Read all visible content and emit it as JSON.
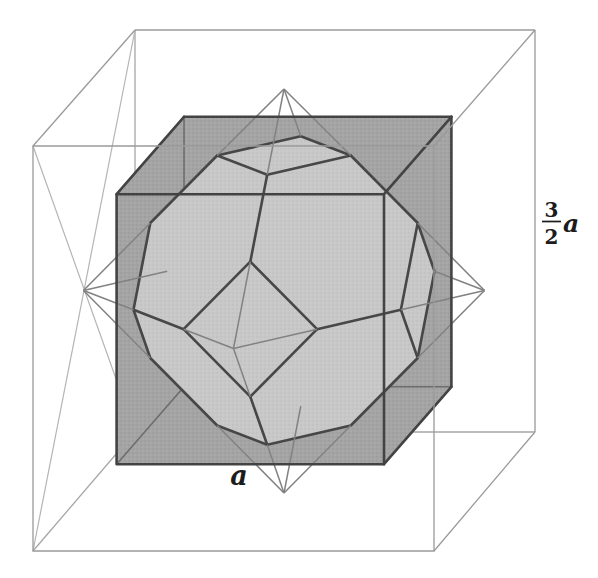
{
  "diagram": {
    "shapes": [
      "outer-cube",
      "inscribed-octahedron",
      "inner-cube",
      "truncated-octahedron"
    ],
    "labels": {
      "outer_edge_length": {
        "numerator": "3",
        "denominator": "2",
        "variable": "a"
      },
      "inner_edge_length": {
        "variable": "a"
      }
    },
    "colors": {
      "background": "#ffffff",
      "outer_cube_line": "#9a9a9a",
      "face_diagonal_line": "#b5b5b5",
      "octahedron_line": "#828282",
      "inner_cube_fill": "#a4a4a4",
      "truncated_octahedron_fill": "#c8c8c8",
      "bold_edge": "#474747",
      "hidden_edge": "#6d6d6d",
      "label_text": "#1c1c1c"
    }
  }
}
